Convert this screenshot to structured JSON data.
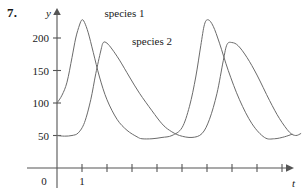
{
  "figure": {
    "problem_number": "7.",
    "background_color": "#ffffff",
    "curve_color": "#6b6b6b",
    "axis_color": "#555555"
  },
  "chart_data": {
    "type": "line",
    "title": "",
    "subtitle": "",
    "xlabel": "t",
    "ylabel": "y",
    "grid": false,
    "legend_position": "inline-annotation",
    "xlim": [
      0,
      9.8
    ],
    "ylim": [
      0,
      245
    ],
    "x_tick_values": [
      1,
      2,
      3,
      4,
      5,
      6,
      7,
      8,
      9
    ],
    "x_tick_labels": [
      "1",
      "",
      "",
      "",
      "",
      "",
      "",
      "",
      ""
    ],
    "y_tick_values": [
      50,
      100,
      150,
      200
    ],
    "y_tick_labels": [
      "50",
      "100",
      "150",
      "200"
    ],
    "origin_label": "0",
    "annotations": [
      {
        "text": "species 1",
        "x": 1.9,
        "y": 232
      },
      {
        "text": "species 2",
        "x": 3.0,
        "y": 190
      }
    ],
    "series": [
      {
        "name": "species 1",
        "label": "species 1",
        "color": "#6b6b6b",
        "start_value": 100,
        "peak_value": 228,
        "trough_value": 45,
        "peak_x": [
          1.0,
          5.9
        ],
        "trough_x": [
          3.4,
          8.3
        ],
        "points_x": [
          0.0,
          0.2,
          0.4,
          0.6,
          0.75,
          0.9,
          1.0,
          1.1,
          1.25,
          1.45,
          1.7,
          2.0,
          2.4,
          2.8,
          3.2,
          3.4,
          3.8,
          4.2,
          4.6,
          5.0,
          5.3,
          5.55,
          5.75,
          5.9,
          6.05,
          6.25,
          6.5,
          6.85,
          7.3,
          7.8,
          8.3,
          8.7,
          9.1,
          9.4
        ],
        "points_y": [
          100,
          112,
          132,
          170,
          200,
          220,
          228,
          224,
          208,
          178,
          140,
          105,
          75,
          58,
          48,
          45,
          45,
          47,
          50,
          62,
          95,
          140,
          188,
          221,
          228,
          218,
          192,
          150,
          105,
          68,
          47,
          45,
          48,
          52
        ]
      },
      {
        "name": "species 2",
        "label": "species 2",
        "color": "#6b6b6b",
        "start_value": 50,
        "peak_value": 193,
        "trough_value": 45,
        "peak_x": [
          1.85,
          6.8
        ],
        "trough_x": [
          4.5,
          9.3
        ],
        "points_x": [
          0.0,
          0.3,
          0.6,
          0.85,
          1.1,
          1.35,
          1.55,
          1.75,
          1.85,
          2.0,
          2.2,
          2.5,
          2.9,
          3.3,
          3.8,
          4.2,
          4.5,
          4.9,
          5.4,
          5.8,
          6.1,
          6.4,
          6.65,
          6.8,
          7.0,
          7.25,
          7.6,
          8.0,
          8.5,
          8.9,
          9.3,
          9.55,
          9.75
        ],
        "points_y": [
          50,
          49,
          50,
          54,
          70,
          105,
          145,
          180,
          193,
          192,
          183,
          166,
          140,
          115,
          88,
          68,
          58,
          50,
          47,
          53,
          75,
          115,
          165,
          190,
          193,
          188,
          170,
          143,
          104,
          76,
          55,
          50,
          53
        ]
      }
    ]
  }
}
